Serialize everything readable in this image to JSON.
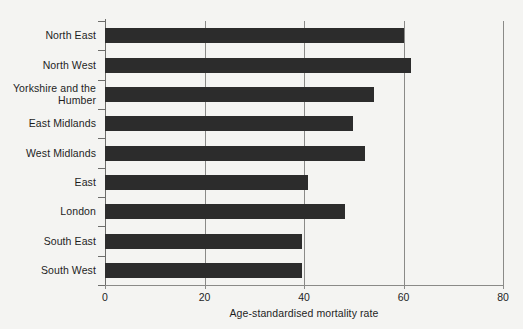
{
  "chart_data": {
    "type": "bar",
    "orientation": "horizontal",
    "title": "",
    "xlabel": "Age-standardised mortality rate",
    "ylabel": "",
    "categories": [
      "North East",
      "North West",
      "Yorkshire and the\nHumber",
      "East Midlands",
      "West Midlands",
      "East",
      "London",
      "South East",
      "South West"
    ],
    "values": [
      60.0,
      61.5,
      54.0,
      49.8,
      52.3,
      40.8,
      48.2,
      39.5,
      39.5
    ],
    "xlim": [
      0,
      80
    ],
    "xticks": [
      0,
      20,
      40,
      60,
      80
    ],
    "xtick_labels": [
      "0",
      "20",
      "40",
      "60",
      "80"
    ],
    "grid": "vertical-only",
    "legend": "none",
    "bar_color": "#2c2c2c",
    "grid_color": "#8a8a88",
    "axis_color": "#6d6d6b",
    "background_color": "#f4f4f2",
    "text_color": "#1e1e1e"
  },
  "axis": {
    "x_title": "Age-standardised mortality rate"
  },
  "ylabels": [
    {
      "line1": "North East",
      "line2": ""
    },
    {
      "line1": "North West",
      "line2": ""
    },
    {
      "line1": "Yorkshire and the",
      "line2": "Humber"
    },
    {
      "line1": "East Midlands",
      "line2": ""
    },
    {
      "line1": "West Midlands",
      "line2": ""
    },
    {
      "line1": "East",
      "line2": ""
    },
    {
      "line1": "London",
      "line2": ""
    },
    {
      "line1": "South East",
      "line2": ""
    },
    {
      "line1": "South West",
      "line2": ""
    }
  ],
  "xticklabels": [
    "0",
    "20",
    "40",
    "60",
    "80"
  ]
}
